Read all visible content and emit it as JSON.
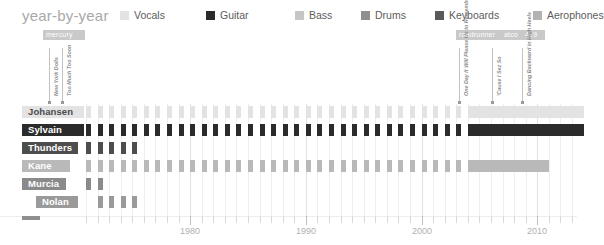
{
  "header": {
    "title": "year-by-year"
  },
  "legend": {
    "items": [
      {
        "label": "Vocals",
        "color": "#e3e3e3",
        "x": 0
      },
      {
        "label": "Guitar",
        "color": "#2b2b2b",
        "x": 86
      },
      {
        "label": "Bass",
        "color": "#c6c6c6",
        "x": 175
      },
      {
        "label": "Drums",
        "color": "#8f8f8f",
        "x": 241
      },
      {
        "label": "Keyboards",
        "color": "#5a5a5a",
        "x": 315
      },
      {
        "label": "Aerophones",
        "color": "#b3b3b3",
        "x": 413
      }
    ]
  },
  "record_labels": [
    {
      "name": "mercury",
      "x": 43,
      "y": 30,
      "width": 36
    },
    {
      "name": "roadrunner",
      "x": 456,
      "y": 30,
      "width": 43
    },
    {
      "name": "atco",
      "x": 501,
      "y": 30,
      "width": 19
    },
    {
      "name": "429",
      "x": 522,
      "y": 30,
      "width": 17
    }
  ],
  "albums": [
    {
      "title": "New York Dolls",
      "x": 49,
      "year": 1973
    },
    {
      "title": "Too Much Too Soon",
      "x": 62,
      "year": 1974
    },
    {
      "title": "One Day It Will Please Us to Remember Even This",
      "x": 459,
      "year": 2006
    },
    {
      "title": "'Cause I Sez So",
      "x": 492,
      "year": 2009
    },
    {
      "title": "Dancing Backward in High Heels",
      "x": 522,
      "year": 2011
    }
  ],
  "chart_data": {
    "type": "timeline",
    "title": "year-by-year",
    "xlabel": "",
    "ylabel": "",
    "xlim": [
      1971,
      2013
    ],
    "grid": true,
    "legend_position": "top",
    "tick_labels": [
      "1980",
      "1990",
      "2000",
      "2010"
    ],
    "tick_values": [
      1980,
      1990,
      2000,
      2010
    ],
    "members": [
      {
        "name": "Johansen",
        "role": "Vocals",
        "color": "#e3e3e3",
        "label_text_color": "#4a4a4a",
        "label_x": 22,
        "label_width": 62,
        "row": 0,
        "active_years": [
          1971,
          1972,
          1973,
          1974,
          1975,
          1976,
          1977,
          1978,
          1979,
          1980,
          1981,
          1982,
          1983,
          1984,
          1985,
          1986,
          1987,
          1988,
          1989,
          1990,
          1991,
          1992,
          1993,
          1994,
          1995,
          1996,
          1997,
          1998,
          1999,
          2000,
          2001,
          2002,
          2003,
          2004,
          2005,
          2006,
          2007,
          2008,
          2009,
          2010,
          2011,
          2012,
          2013
        ],
        "continuous_from": 2004
      },
      {
        "name": "Sylvain",
        "role": "Guitar",
        "color": "#2b2b2b",
        "label_text_color": "#ffffff",
        "label_x": 22,
        "label_width": 62,
        "row": 1,
        "active_years": [
          1971,
          1972,
          1973,
          1974,
          1975,
          1976,
          1977,
          1978,
          1979,
          1980,
          1981,
          1982,
          1983,
          1984,
          1985,
          1986,
          1987,
          1988,
          1989,
          1990,
          1991,
          1992,
          1993,
          1994,
          1995,
          1996,
          1997,
          1998,
          1999,
          2000,
          2001,
          2002,
          2003,
          2004,
          2005,
          2006,
          2007,
          2008,
          2009,
          2010,
          2011,
          2012,
          2013
        ],
        "continuous_from": 2004
      },
      {
        "name": "Thunders",
        "role": "Guitar",
        "color": "#4d4d4d",
        "label_text_color": "#ffffff",
        "label_x": 22,
        "label_width": 56,
        "row": 2,
        "active_years": [
          1971,
          1972,
          1973,
          1974,
          1975
        ],
        "continuous_from": null
      },
      {
        "name": "Kane",
        "role": "Bass",
        "color": "#b9b9b9",
        "label_text_color": "#ffffff",
        "label_x": 22,
        "label_width": 48,
        "row": 3,
        "active_years": [
          1971,
          1972,
          1973,
          1974,
          1975,
          1976,
          1977,
          1978,
          1979,
          1980,
          1981,
          1982,
          1983,
          1984,
          1985,
          1986,
          1987,
          1988,
          1989,
          1990,
          1991,
          1992,
          1993,
          1994,
          1995,
          1996,
          1997,
          1998,
          1999,
          2000,
          2001,
          2002,
          2003,
          2004,
          2005,
          2006,
          2007,
          2008,
          2009,
          2010
        ],
        "continuous_from": 2004
      },
      {
        "name": "Murcia",
        "role": "Drums",
        "color": "#8a8a8a",
        "label_text_color": "#ffffff",
        "label_x": 22,
        "label_width": 44,
        "row": 4,
        "active_years": [
          1971,
          1972
        ],
        "continuous_from": null
      },
      {
        "name": "Nolan",
        "role": "Drums",
        "color": "#9a9a9a",
        "label_text_color": "#ffffff",
        "label_x": 36,
        "label_width": 42,
        "row": 5,
        "active_years": [
          1972,
          1973,
          1974,
          1975
        ],
        "continuous_from": null
      }
    ]
  }
}
